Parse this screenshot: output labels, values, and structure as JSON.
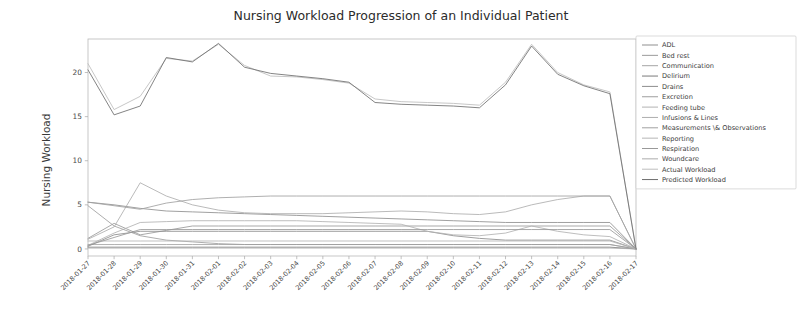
{
  "chart_data": {
    "type": "line",
    "title": "Nursing Workload Progression of an Individual Patient",
    "xlabel": "",
    "ylabel": "Nursing Workload",
    "ylim": [
      -0.8,
      23.8
    ],
    "yticks": [
      0,
      5,
      10,
      15,
      20
    ],
    "grid": false,
    "legend_position": "upper right",
    "x": [
      "2018-01-27",
      "2018-01-28",
      "2018-01-29",
      "2018-01-30",
      "2018-01-31",
      "2018-02-01",
      "2018-02-02",
      "2018-02-03",
      "2018-02-04",
      "2018-02-05",
      "2018-02-06",
      "2018-02-07",
      "2018-02-08",
      "2018-02-09",
      "2018-02-10",
      "2018-02-11",
      "2018-02-12",
      "2018-02-13",
      "2018-02-14",
      "2018-02-15",
      "2018-02-16",
      "2018-02-17"
    ],
    "series": [
      {
        "name": "ADL",
        "color": "#8f8f8f",
        "values": [
          5.3,
          5.0,
          4.6,
          4.3,
          4.2,
          4.1,
          4.0,
          3.9,
          3.8,
          3.7,
          3.6,
          3.5,
          3.4,
          3.3,
          3.2,
          3.1,
          3.0,
          3.0,
          3.0,
          3.0,
          3.0,
          0.0
        ]
      },
      {
        "name": "Bed rest",
        "color": "#9a9a9a",
        "values": [
          1.2,
          2.9,
          1.6,
          2.1,
          2.6,
          2.6,
          2.6,
          2.6,
          2.6,
          2.6,
          2.6,
          2.6,
          2.6,
          2.6,
          2.6,
          2.6,
          2.6,
          2.6,
          2.6,
          2.6,
          2.6,
          0.0
        ]
      },
      {
        "name": "Communication",
        "color": "#a5a5a5",
        "values": [
          0.5,
          0.5,
          0.5,
          0.5,
          0.5,
          0.5,
          0.5,
          0.5,
          0.5,
          0.5,
          0.5,
          0.5,
          0.5,
          0.5,
          0.5,
          0.5,
          0.5,
          0.5,
          0.5,
          0.5,
          0.5,
          0.0
        ]
      },
      {
        "name": "Delirium",
        "color": "#7a7a7a",
        "values": [
          0.2,
          0.2,
          0.2,
          0.2,
          0.2,
          0.2,
          0.2,
          0.2,
          0.2,
          0.2,
          0.2,
          0.2,
          0.2,
          0.2,
          0.2,
          0.2,
          0.2,
          0.2,
          0.2,
          0.2,
          0.2,
          0.0
        ]
      },
      {
        "name": "Drains",
        "color": "#8c8c8c",
        "values": [
          0.3,
          1.6,
          2.0,
          2.0,
          2.0,
          2.0,
          2.0,
          2.0,
          2.0,
          2.0,
          2.0,
          2.0,
          2.0,
          2.0,
          1.5,
          1.2,
          1.0,
          1.0,
          1.0,
          1.0,
          1.0,
          0.0
        ]
      },
      {
        "name": "Excretion",
        "color": "#9e9e9e",
        "values": [
          4.9,
          2.6,
          1.5,
          1.0,
          0.8,
          0.6,
          0.5,
          0.5,
          0.5,
          0.5,
          0.5,
          0.5,
          0.5,
          0.5,
          0.5,
          0.5,
          0.5,
          0.5,
          0.5,
          0.5,
          0.5,
          0.0
        ]
      },
      {
        "name": "Feeding tube",
        "color": "#b2b2b2",
        "values": [
          0.4,
          1.8,
          3.0,
          3.1,
          3.2,
          3.2,
          3.2,
          3.2,
          3.2,
          3.1,
          3.0,
          2.9,
          2.8,
          2.0,
          1.6,
          1.5,
          1.8,
          2.6,
          2.0,
          1.6,
          1.4,
          0.0
        ]
      },
      {
        "name": "Infusions & Lines",
        "color": "#aeaeae",
        "values": [
          1.1,
          2.5,
          7.5,
          6.0,
          5.0,
          4.4,
          4.1,
          4.0,
          4.0,
          4.0,
          4.1,
          4.2,
          4.3,
          4.2,
          4.0,
          3.9,
          4.2,
          5.0,
          5.6,
          6.0,
          6.0,
          0.0
        ]
      },
      {
        "name": "Measurements \\& Observations",
        "color": "#a0a0a0",
        "values": [
          5.3,
          4.9,
          4.5,
          5.2,
          5.6,
          5.8,
          5.9,
          6.0,
          6.0,
          6.0,
          6.0,
          6.0,
          6.0,
          6.0,
          6.0,
          6.0,
          6.0,
          6.0,
          6.0,
          6.0,
          6.0,
          0.0
        ]
      },
      {
        "name": "Reporting",
        "color": "#b5b5b5",
        "values": [
          0.9,
          0.9,
          0.9,
          0.9,
          0.9,
          0.9,
          0.9,
          0.9,
          0.9,
          0.9,
          0.9,
          0.9,
          0.9,
          0.9,
          0.9,
          0.9,
          0.9,
          0.9,
          0.9,
          0.9,
          0.9,
          0.0
        ]
      },
      {
        "name": "Respiration",
        "color": "#999999",
        "values": [
          0.4,
          1.3,
          2.2,
          2.2,
          2.2,
          2.2,
          2.2,
          2.2,
          2.2,
          2.2,
          2.2,
          2.2,
          2.2,
          2.2,
          2.2,
          2.2,
          2.2,
          2.2,
          2.2,
          2.2,
          2.2,
          0.0
        ]
      },
      {
        "name": "Woundcare",
        "color": "#acacac",
        "values": [
          0.1,
          0.1,
          0.1,
          0.1,
          0.1,
          0.1,
          0.1,
          0.1,
          0.1,
          0.1,
          0.1,
          0.1,
          0.1,
          0.1,
          0.1,
          0.1,
          0.1,
          0.1,
          0.1,
          0.1,
          0.1,
          0.0
        ]
      },
      {
        "name": "Actual Workload",
        "color": "#bdbdbd",
        "values": [
          21.0,
          15.8,
          17.3,
          21.6,
          21.3,
          23.2,
          20.8,
          19.6,
          19.5,
          19.2,
          18.8,
          17.0,
          16.7,
          16.6,
          16.5,
          16.3,
          18.9,
          23.2,
          20.0,
          18.6,
          17.8,
          0.0
        ]
      },
      {
        "name": "Predicted Workload",
        "color": "#6e6e6e",
        "values": [
          20.3,
          15.2,
          16.2,
          21.7,
          21.2,
          23.3,
          20.6,
          19.9,
          19.6,
          19.3,
          18.9,
          16.6,
          16.4,
          16.3,
          16.2,
          16.0,
          18.6,
          23.0,
          19.8,
          18.5,
          17.6,
          0.0
        ]
      }
    ]
  }
}
